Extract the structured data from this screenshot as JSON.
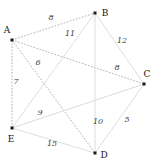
{
  "figure": {
    "width": 156,
    "height": 165,
    "background": "#ffffff"
  },
  "colors": {
    "node": "#1a1a1a",
    "node_label": "#141414",
    "edge_label": "#3a3a3a",
    "edge_dashed": "#8c8c8c",
    "edge_solid": "#d9d9d9"
  },
  "chart_data": {
    "type": "diagram",
    "subtype": "weighted-graph",
    "title": "",
    "directed": false,
    "nodes": [
      {
        "id": "A",
        "label": "A",
        "x": 12,
        "y": 40,
        "label_x": 7,
        "label_y": 30
      },
      {
        "id": "B",
        "label": "B",
        "x": 95,
        "y": 13,
        "label_x": 105,
        "label_y": 13
      },
      {
        "id": "C",
        "label": "C",
        "x": 144,
        "y": 84,
        "label_x": 147,
        "label_y": 74
      },
      {
        "id": "D",
        "label": "D",
        "x": 95,
        "y": 153,
        "label_x": 104,
        "label_y": 155
      },
      {
        "id": "E",
        "label": "E",
        "x": 12,
        "y": 128,
        "label_x": 11,
        "label_y": 139
      }
    ],
    "edges": [
      {
        "source": "A",
        "target": "B",
        "weight": 8,
        "style": "dashed",
        "label_x": 51,
        "label_y": 18
      },
      {
        "source": "B",
        "target": "E",
        "weight": 11,
        "style": "solid",
        "label_x": 70,
        "label_y": 34
      },
      {
        "source": "B",
        "target": "C",
        "weight": 12,
        "style": "solid",
        "label_x": 122,
        "label_y": 41
      },
      {
        "source": "A",
        "target": "D",
        "weight": 6,
        "style": "dashed",
        "label_x": 38,
        "label_y": 63
      },
      {
        "source": "A",
        "target": "C",
        "weight": 8,
        "style": "dashed",
        "label_x": 117,
        "label_y": 68
      },
      {
        "source": "A",
        "target": "E",
        "weight": 7,
        "style": "dashed",
        "label_x": 16,
        "label_y": 82
      },
      {
        "source": "E",
        "target": "C",
        "weight": 9,
        "style": "solid",
        "label_x": 40,
        "label_y": 113
      },
      {
        "source": "B",
        "target": "D",
        "weight": 10,
        "style": "solid",
        "label_x": 98,
        "label_y": 122
      },
      {
        "source": "C",
        "target": "D",
        "weight": 5,
        "style": "solid",
        "label_x": 127,
        "label_y": 120
      },
      {
        "source": "E",
        "target": "D",
        "weight": 15,
        "style": "solid",
        "label_x": 52,
        "label_y": 144
      }
    ],
    "xlabel": "",
    "ylabel": "",
    "legend": []
  }
}
